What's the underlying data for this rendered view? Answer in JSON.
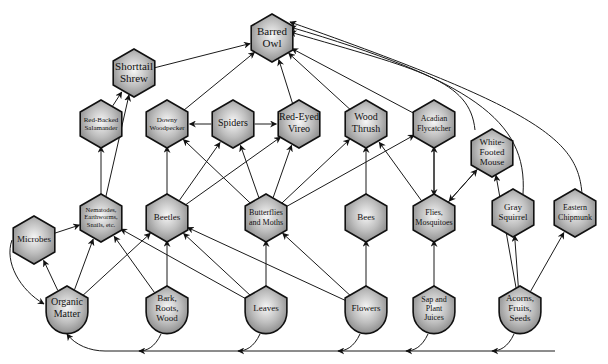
{
  "diagram": {
    "title": "",
    "type": "food-web",
    "colors": {
      "node_fill_center": "#f4f4f4",
      "node_fill_edge": "#8a8a8a",
      "node_stroke": "#111111",
      "edge": "#1a1a1a",
      "background": "#ffffff"
    },
    "nodes": [
      {
        "id": "barred_owl",
        "label": [
          "Barred",
          "Owl"
        ],
        "x": 272,
        "y": 38,
        "shape": "hex",
        "fs": 11
      },
      {
        "id": "shorttail_shrew",
        "label": [
          "Shorttail",
          "Shrew"
        ],
        "x": 134,
        "y": 73,
        "shape": "hex",
        "fs": 11
      },
      {
        "id": "red_backed_salamander",
        "label": [
          "Red-Backed",
          "Salamander"
        ],
        "x": 101,
        "y": 124,
        "shape": "hex",
        "fs": 7
      },
      {
        "id": "downy_woodpecker",
        "label": [
          "Downy",
          "Woodpecker"
        ],
        "x": 167,
        "y": 124,
        "shape": "hex",
        "fs": 7
      },
      {
        "id": "spiders",
        "label": [
          "Spiders"
        ],
        "x": 233,
        "y": 124,
        "shape": "hex",
        "fs": 10
      },
      {
        "id": "red_eyed_vireo",
        "label": [
          "Red-Eyed",
          "Vireo"
        ],
        "x": 299,
        "y": 124,
        "shape": "hex",
        "fs": 10
      },
      {
        "id": "wood_thrush",
        "label": [
          "Wood",
          "Thrush"
        ],
        "x": 366,
        "y": 124,
        "shape": "hex",
        "fs": 10
      },
      {
        "id": "acadian_flycatcher",
        "label": [
          "Acadian",
          "Flycatcher"
        ],
        "x": 434,
        "y": 124,
        "shape": "hex",
        "fs": 8
      },
      {
        "id": "white_footed_mouse",
        "label": [
          "White-",
          "Footed",
          "Mouse"
        ],
        "x": 492,
        "y": 153,
        "shape": "hex",
        "fs": 9
      },
      {
        "id": "microbes",
        "label": [
          "Microbes"
        ],
        "x": 34,
        "y": 240,
        "shape": "hex",
        "fs": 9
      },
      {
        "id": "nematodes",
        "label": [
          "Nematodes,",
          "Earthworms,",
          "Snails, etc."
        ],
        "x": 101,
        "y": 218,
        "shape": "hex",
        "fs": 6.5
      },
      {
        "id": "beetles",
        "label": [
          "Beetles"
        ],
        "x": 167,
        "y": 218,
        "shape": "hex",
        "fs": 9
      },
      {
        "id": "butterflies_moths",
        "label": [
          "Butterflies",
          "and Moths"
        ],
        "x": 266,
        "y": 218,
        "shape": "hex",
        "fs": 8
      },
      {
        "id": "bees",
        "label": [
          "Bees"
        ],
        "x": 366,
        "y": 218,
        "shape": "hex",
        "fs": 9
      },
      {
        "id": "flies_mosquitoes",
        "label": [
          "Flies,",
          "Mosquitoes"
        ],
        "x": 434,
        "y": 218,
        "shape": "hex",
        "fs": 8
      },
      {
        "id": "gray_squirrel",
        "label": [
          "Gray",
          "Squirrel"
        ],
        "x": 513,
        "y": 213,
        "shape": "hex",
        "fs": 9
      },
      {
        "id": "eastern_chipmunk",
        "label": [
          "Eastern",
          "Chipmunk"
        ],
        "x": 575,
        "y": 213,
        "shape": "hex",
        "fs": 8
      },
      {
        "id": "organic_matter",
        "label": [
          "Organic",
          "Matter"
        ],
        "x": 67,
        "y": 310,
        "shape": "shield",
        "fs": 10
      },
      {
        "id": "bark_roots_wood",
        "label": [
          "Bark,",
          "Roots,",
          "Wood"
        ],
        "x": 167,
        "y": 310,
        "shape": "shield",
        "fs": 9
      },
      {
        "id": "leaves",
        "label": [
          "Leaves"
        ],
        "x": 266,
        "y": 310,
        "shape": "shield",
        "fs": 9
      },
      {
        "id": "flowers",
        "label": [
          "Flowers"
        ],
        "x": 366,
        "y": 310,
        "shape": "shield",
        "fs": 9
      },
      {
        "id": "sap_plant_juices",
        "label": [
          "Sap and",
          "Plant",
          "Juices"
        ],
        "x": 434,
        "y": 310,
        "shape": "shield",
        "fs": 8
      },
      {
        "id": "acorns_fruits_seeds",
        "label": [
          "Acorns,",
          "Fruits,",
          "Seeds"
        ],
        "x": 520,
        "y": 310,
        "shape": "shield",
        "fs": 9
      }
    ],
    "edges": [
      {
        "from": "shorttail_shrew",
        "to": "barred_owl"
      },
      {
        "from": "downy_woodpecker",
        "to": "barred_owl"
      },
      {
        "from": "red_eyed_vireo",
        "to": "barred_owl"
      },
      {
        "from": "wood_thrush",
        "to": "barred_owl"
      },
      {
        "from": "acadian_flycatcher",
        "to": "barred_owl"
      },
      {
        "from": "white_footed_mouse",
        "to": "barred_owl",
        "curve": "M 475 130 C 470 80 420 70 290 32"
      },
      {
        "from": "gray_squirrel",
        "to": "barred_owl",
        "curve": "M 523 194 C 528 120 470 80 290 27"
      },
      {
        "from": "eastern_chipmunk",
        "to": "barred_owl",
        "curve": "M 582 194 C 578 140 540 110 290 22"
      },
      {
        "from": "red_backed_salamander",
        "to": "shorttail_shrew"
      },
      {
        "from": "nematodes",
        "to": "shorttail_shrew"
      },
      {
        "from": "nematodes",
        "to": "red_backed_salamander"
      },
      {
        "from": "spiders",
        "to": "downy_woodpecker"
      },
      {
        "from": "spiders",
        "to": "red_eyed_vireo"
      },
      {
        "from": "beetles",
        "to": "downy_woodpecker"
      },
      {
        "from": "beetles",
        "to": "spiders"
      },
      {
        "from": "beetles",
        "to": "red_eyed_vireo"
      },
      {
        "from": "butterflies_moths",
        "to": "downy_woodpecker"
      },
      {
        "from": "butterflies_moths",
        "to": "spiders"
      },
      {
        "from": "butterflies_moths",
        "to": "red_eyed_vireo"
      },
      {
        "from": "butterflies_moths",
        "to": "wood_thrush"
      },
      {
        "from": "butterflies_moths",
        "to": "acadian_flycatcher"
      },
      {
        "from": "bees",
        "to": "wood_thrush"
      },
      {
        "from": "flies_mosquitoes",
        "to": "wood_thrush"
      },
      {
        "from": "flies_mosquitoes",
        "to": "acadian_flycatcher"
      },
      {
        "from": "acadian_flycatcher",
        "to": "flies_mosquitoes"
      },
      {
        "from": "flies_mosquitoes",
        "to": "white_footed_mouse"
      },
      {
        "from": "white_footed_mouse",
        "to": "flies_mosquitoes"
      },
      {
        "from": "acorns_fruits_seeds",
        "to": "white_footed_mouse"
      },
      {
        "from": "acorns_fruits_seeds",
        "to": "gray_squirrel"
      },
      {
        "from": "acorns_fruits_seeds",
        "to": "eastern_chipmunk"
      },
      {
        "from": "microbes",
        "to": "nematodes"
      },
      {
        "from": "organic_matter",
        "to": "microbes"
      },
      {
        "from": "organic_matter",
        "to": "nematodes"
      },
      {
        "from": "organic_matter",
        "to": "beetles"
      },
      {
        "from": "microbes",
        "to": "organic_matter",
        "curve": "M 12 240 C 4 262 20 290 44 304"
      },
      {
        "from": "bark_roots_wood",
        "to": "nematodes"
      },
      {
        "from": "bark_roots_wood",
        "to": "beetles"
      },
      {
        "from": "leaves",
        "to": "nematodes"
      },
      {
        "from": "leaves",
        "to": "beetles"
      },
      {
        "from": "leaves",
        "to": "butterflies_moths"
      },
      {
        "from": "flowers",
        "to": "beetles"
      },
      {
        "from": "flowers",
        "to": "butterflies_moths"
      },
      {
        "from": "flowers",
        "to": "bees"
      },
      {
        "from": "sap_plant_juices",
        "to": "flies_mosquitoes"
      }
    ],
    "decay_flow": {
      "description": "Dead matter from producers returns to Organic Matter along bottom line",
      "baseline_y": 351,
      "sources": [
        "acorns_fruits_seeds",
        "sap_plant_juices",
        "flowers",
        "leaves",
        "bark_roots_wood"
      ],
      "target": "organic_matter"
    }
  }
}
